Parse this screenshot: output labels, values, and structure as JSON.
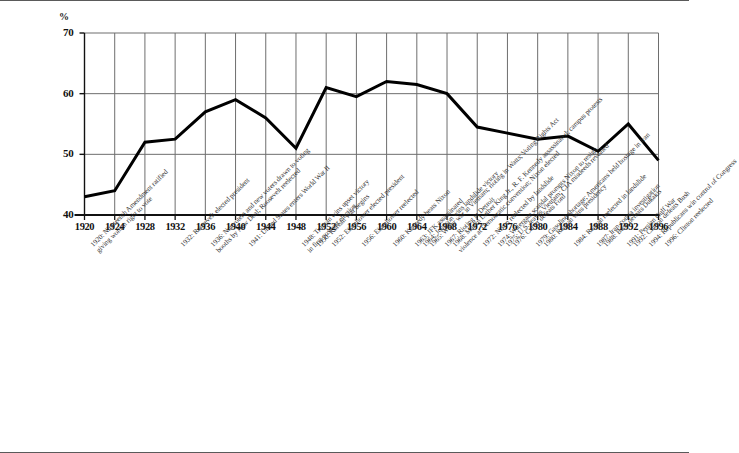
{
  "chart_data": {
    "type": "line",
    "title": "",
    "subtitle": "",
    "xlabel": "",
    "ylabel": "%",
    "ylim": [
      40,
      70
    ],
    "xlim": [
      1920,
      1996
    ],
    "yticks": [
      40,
      50,
      60,
      70
    ],
    "ytick_labels": [
      "40",
      "50",
      "60",
      "70"
    ],
    "grid": true,
    "grid_axis": "both",
    "legend": null,
    "legend_position": "none",
    "categories": [
      1920,
      1924,
      1928,
      1932,
      1936,
      1940,
      1944,
      1948,
      1952,
      1956,
      1960,
      1964,
      1968,
      1972,
      1976,
      1980,
      1984,
      1988,
      1992,
      1996
    ],
    "xtick_labels": [
      "1920",
      "1924",
      "1928",
      "1932",
      "1936",
      "1940",
      "1944",
      "1948",
      "1952",
      "1956",
      "1960",
      "1964",
      "1968",
      "1972",
      "1976",
      "1980",
      "1984",
      "1988",
      "1992",
      "1996"
    ],
    "values": [
      43.0,
      44.0,
      52.0,
      52.5,
      57.0,
      59.0,
      56.0,
      51.0,
      61.0,
      59.5,
      62.0,
      61.5,
      60.0,
      54.5,
      53.5,
      52.5,
      53.0,
      50.5,
      55.0,
      49.0
    ],
    "series": [
      {
        "name": "Voter turnout",
        "values": [
          43.0,
          44.0,
          52.0,
          52.5,
          57.0,
          59.0,
          56.0,
          51.0,
          61.0,
          59.5,
          62.0,
          61.5,
          60.0,
          54.5,
          53.5,
          52.5,
          53.0,
          50.5,
          55.0,
          49.0
        ],
        "color": "#000000",
        "line_width": 3
      }
    ],
    "annotations": [
      {
        "year": 1920,
        "anchor_index": 0,
        "lines": [
          "1920: Nineteenth Amendment ratified",
          "giving women right to vote"
        ]
      },
      {
        "year": 1932,
        "anchor_index": 3,
        "lines": [
          "1932: Roosevelt elected president"
        ]
      },
      {
        "year": 1936,
        "anchor_index": 4,
        "lines": [
          "1936: Nonvoters and new voters drawn to voting",
          "booths by New Deal; Roosevelt reelected"
        ]
      },
      {
        "year": 1941,
        "anchor_index": 5,
        "lines": [
          "1941: United States enters World War II"
        ]
      },
      {
        "year": 1948,
        "anchor_index": 7,
        "lines": [
          "1948: Truman wins upset victory",
          "in first postwar election"
        ]
      },
      {
        "year": 1950,
        "anchor_index": 7,
        "lines": [
          "1950: Korean War begins"
        ]
      },
      {
        "year": 1952,
        "anchor_index": 8,
        "lines": [
          "1952: Eisenhower elected president"
        ]
      },
      {
        "year": 1956,
        "anchor_index": 9,
        "lines": [
          "1956: Eisenhower reelected"
        ]
      },
      {
        "year": 1960,
        "anchor_index": 10,
        "lines": [
          "1960: Kennedy beats Nixon"
        ]
      },
      {
        "year": 1963,
        "anchor_index": 10,
        "lines": [
          "1963: JFK assassinated"
        ]
      },
      {
        "year": 1964,
        "anchor_index": 11,
        "lines": [
          "1964: Johnson wins landslide victory"
        ]
      },
      {
        "year": 1965,
        "anchor_index": 11,
        "lines": [
          "1965: Wider war in Vietnam; rioting in Watts; Voting Rights Act"
        ]
      },
      {
        "year": 1967,
        "anchor_index": 12,
        "lines": [
          "1967: Rioting in Detroit"
        ]
      },
      {
        "year": 1968,
        "anchor_index": 12,
        "lines": [
          "1968: Martin Luther King Jr., R. F. Kennedy assassinated; campus protests",
          "violence at Democratic convention; Nixon elected"
        ]
      },
      {
        "year": 1972,
        "anchor_index": 13,
        "lines": [
          "1972: Nixon reelected by landslide"
        ]
      },
      {
        "year": 1974,
        "anchor_index": 13,
        "lines": [
          "1974: Watergate scandal prompts Nixon to resign"
        ]
      },
      {
        "year": 1975,
        "anchor_index": 14,
        "lines": [
          "1975: U.S. leaves Vietnam; CIA misdeeds revealed"
        ]
      },
      {
        "year": 1976,
        "anchor_index": 14,
        "lines": [
          "1976: Carter defeats Ford"
        ]
      },
      {
        "year": 1979,
        "anchor_index": 15,
        "lines": [
          "1979: Gasoline shortage; Americans held hostage in Iran"
        ]
      },
      {
        "year": 1980,
        "anchor_index": 15,
        "lines": [
          "1980: Reagan wins presidency"
        ]
      },
      {
        "year": 1984,
        "anchor_index": 16,
        "lines": [
          "1984: Reagan reelected in landslide"
        ]
      },
      {
        "year": 1987,
        "anchor_index": 17,
        "lines": [
          "1987: Iran-contra investigation"
        ]
      },
      {
        "year": 1988,
        "anchor_index": 17,
        "lines": [
          "1988: Bush defeats Dukakis"
        ]
      },
      {
        "year": 1991,
        "anchor_index": 18,
        "lines": [
          "1991: Persian Gulf War"
        ]
      },
      {
        "year": 1992,
        "anchor_index": 18,
        "lines": [
          "1992: Clinton defeats Bush"
        ]
      },
      {
        "year": 1994,
        "anchor_index": 19,
        "lines": [
          "1994: Republicans win control of Congress"
        ]
      },
      {
        "year": 1996,
        "anchor_index": 19,
        "lines": [
          "1996: Clinton reelected"
        ]
      }
    ]
  },
  "colors": {
    "line": "#000000",
    "grid": "#6e6e6e",
    "axis": "#111111",
    "text": "#111111",
    "annotation_text": "#2e2e2e",
    "background": "#ffffff",
    "rule": "#5a5a5a"
  }
}
